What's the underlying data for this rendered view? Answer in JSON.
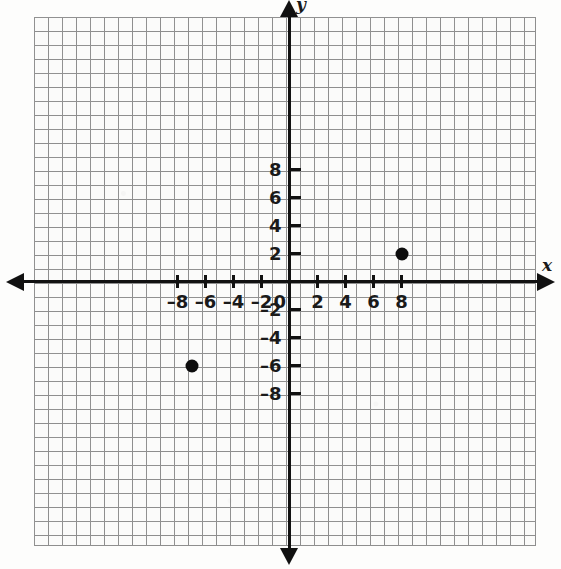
{
  "chart_data": {
    "type": "scatter",
    "title": "",
    "xlabel": "x",
    "ylabel": "y",
    "xlim": [
      -10,
      10
    ],
    "ylim": [
      -10,
      10
    ],
    "grid": true,
    "grid_step": 1,
    "tick_step": 2,
    "legend": "none",
    "points": [
      {
        "label": "point-1",
        "x": 8,
        "y": 2
      },
      {
        "label": "point-2",
        "x": -7,
        "y": -6
      }
    ],
    "x_tick_labels": [
      "–8",
      "–6",
      "–4",
      "–2",
      "0",
      "2",
      "4",
      "6",
      "8"
    ],
    "x_tick_values": [
      -8,
      -6,
      -4,
      -2,
      0,
      2,
      4,
      6,
      8
    ],
    "y_tick_labels": [
      "8",
      "6",
      "4",
      "2",
      "–2",
      "–4",
      "–6",
      "–8"
    ],
    "y_tick_values": [
      8,
      6,
      4,
      2,
      -2,
      -4,
      -6,
      -8
    ],
    "origin_label": "0",
    "axis_color": "#111111",
    "grid_color": "#8e8e8e",
    "point_color": "#0d0d0d",
    "background_color": "#fbfbfa"
  }
}
